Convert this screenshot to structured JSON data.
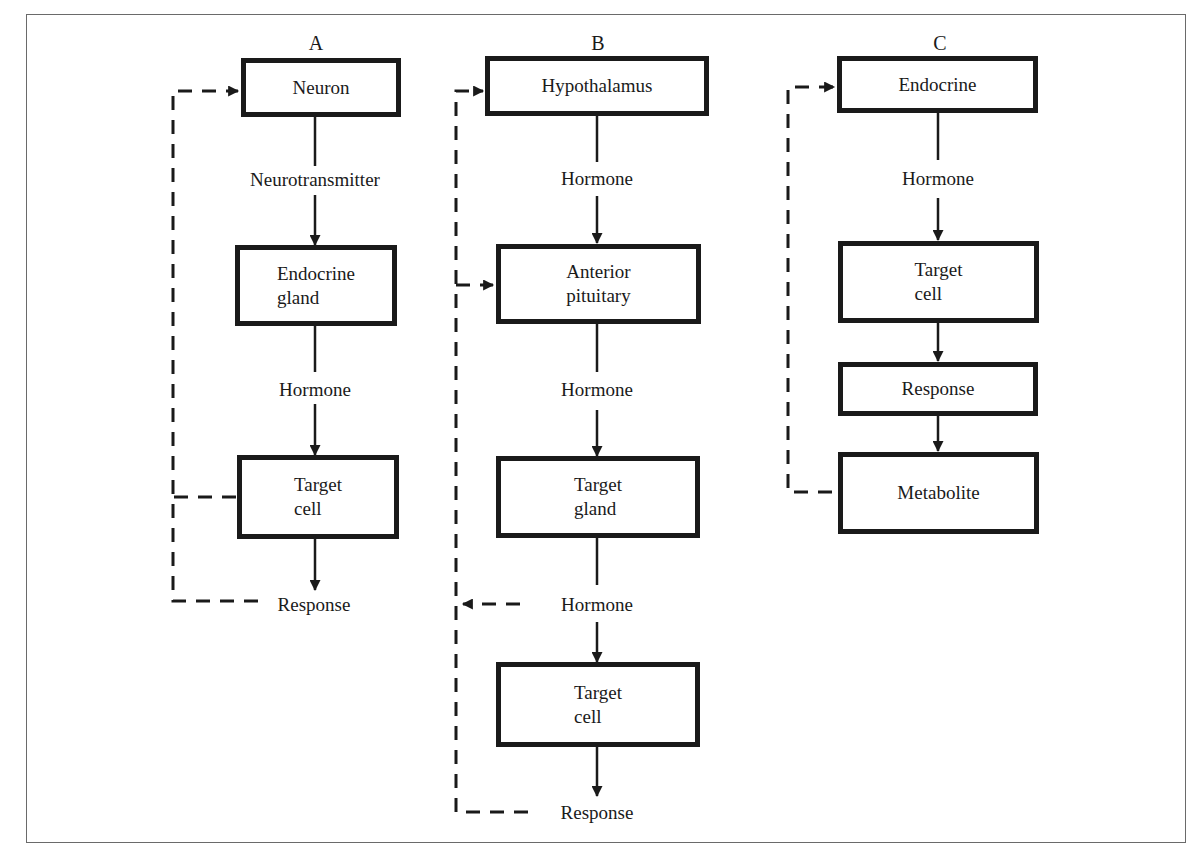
{
  "diagram": {
    "columns": [
      {
        "id": "A",
        "title": "A",
        "nodes": {
          "neuron": "Neuron",
          "endocrine_gland": "Endocrine\ngland",
          "target_cell": "Target\ncell"
        },
        "labels": {
          "neurotransmitter": "Neurotransmitter",
          "hormone": "Hormone",
          "response": "Response"
        }
      },
      {
        "id": "B",
        "title": "B",
        "nodes": {
          "hypothalamus": "Hypothalamus",
          "anterior_pituitary": "Anterior\npituitary",
          "target_gland": "Target\ngland",
          "target_cell": "Target\ncell"
        },
        "labels": {
          "hormone_1": "Hormone",
          "hormone_2": "Hormone",
          "hormone_3": "Hormone",
          "response": "Response"
        }
      },
      {
        "id": "C",
        "title": "C",
        "nodes": {
          "endocrine": "Endocrine",
          "target_cell": "Target\ncell",
          "response": "Response",
          "metabolite": "Metabolite"
        },
        "labels": {
          "hormone": "Hormone"
        }
      }
    ],
    "edges": [
      {
        "from": "A.neuron",
        "to": "A.endocrine_gland",
        "via": "Neurotransmitter",
        "style": "solid"
      },
      {
        "from": "A.endocrine_gland",
        "to": "A.target_cell",
        "via": "Hormone",
        "style": "solid"
      },
      {
        "from": "A.target_cell",
        "to": "A.response",
        "style": "solid"
      },
      {
        "from": "A.target_cell",
        "to": "A.neuron",
        "style": "dashed",
        "type": "feedback"
      },
      {
        "from": "A.response",
        "to": "A.neuron",
        "style": "dashed",
        "type": "feedback"
      },
      {
        "from": "B.hypothalamus",
        "to": "B.anterior_pituitary",
        "via": "Hormone",
        "style": "solid"
      },
      {
        "from": "B.anterior_pituitary",
        "to": "B.target_gland",
        "via": "Hormone",
        "style": "solid"
      },
      {
        "from": "B.target_gland",
        "to": "B.target_cell",
        "via": "Hormone",
        "style": "solid"
      },
      {
        "from": "B.target_cell",
        "to": "B.response",
        "style": "solid"
      },
      {
        "from": "B.response",
        "to": "B.hypothalamus",
        "style": "dashed",
        "type": "feedback"
      },
      {
        "from": "B.response",
        "to": "B.anterior_pituitary",
        "style": "dashed",
        "type": "feedback"
      },
      {
        "from": "B.hormone_3",
        "to": "B.feedback_line",
        "style": "dashed",
        "type": "feedback"
      },
      {
        "from": "C.endocrine",
        "to": "C.target_cell",
        "via": "Hormone",
        "style": "solid"
      },
      {
        "from": "C.target_cell",
        "to": "C.response",
        "style": "solid"
      },
      {
        "from": "C.response",
        "to": "C.metabolite",
        "style": "solid"
      },
      {
        "from": "C.metabolite",
        "to": "C.endocrine",
        "style": "dashed",
        "type": "feedback"
      }
    ],
    "colors": {
      "ink": "#1a1a1a",
      "frame": "#6a6a6a",
      "background": "#ffffff"
    }
  }
}
